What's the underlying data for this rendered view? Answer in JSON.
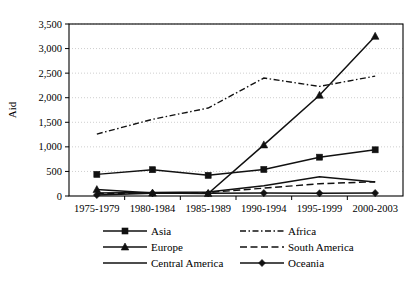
{
  "chart_data": {
    "type": "line",
    "title": "",
    "xlabel": "",
    "ylabel": "Aid",
    "ylim": [
      0,
      3500
    ],
    "ytick_step": 500,
    "ytick_labels": [
      "0",
      "500",
      "1,000",
      "1,500",
      "2,000",
      "2,500",
      "3,000",
      "3,500"
    ],
    "grid": true,
    "legend_position": "bottom",
    "categories": [
      "1975-1979",
      "1980-1984",
      "1985-1989",
      "1990-1994",
      "1995-1999",
      "2000-2003"
    ],
    "series": [
      {
        "name": "Asia",
        "marker": "square",
        "dash": "none",
        "values": [
          440,
          535,
          420,
          540,
          790,
          940
        ]
      },
      {
        "name": "Africa",
        "marker": "none",
        "dash": "dash-dot",
        "values": [
          1260,
          1560,
          1790,
          2400,
          2230,
          2440
        ]
      },
      {
        "name": "Europe",
        "marker": "triangle",
        "dash": "none",
        "values": [
          130,
          60,
          50,
          1040,
          2050,
          3250
        ]
      },
      {
        "name": "South America",
        "marker": "none",
        "dash": "dashed",
        "values": [
          50,
          60,
          70,
          160,
          250,
          290
        ]
      },
      {
        "name": "Central America",
        "marker": "none",
        "dash": "none",
        "values": [
          60,
          70,
          80,
          210,
          390,
          285
        ]
      },
      {
        "name": "Oceania",
        "marker": "diamond",
        "dash": "none",
        "values": [
          20,
          55,
          55,
          60,
          55,
          60
        ]
      }
    ]
  },
  "legend": {
    "entries": [
      {
        "label": "Asia"
      },
      {
        "label": "Africa"
      },
      {
        "label": "Europe"
      },
      {
        "label": "South America"
      },
      {
        "label": "Central America"
      },
      {
        "label": "Oceania"
      }
    ]
  },
  "colors": {
    "line": "#111111",
    "grid": "#b9b9b9",
    "axis": "#000000",
    "background": "#ffffff"
  }
}
